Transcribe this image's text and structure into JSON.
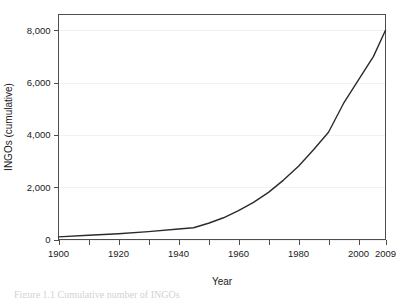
{
  "figure": {
    "caption": "Figure 1.1  Cumulative number of INGOs"
  },
  "chart_data": {
    "type": "line",
    "title": "",
    "xlabel": "Year",
    "ylabel": "INGOs (cumulative)",
    "xlim": [
      1900,
      2009
    ],
    "ylim": [
      0,
      8600
    ],
    "grid": true,
    "grid_axis": "y",
    "legend": false,
    "legend_position": "none",
    "line_color": "#2b2b2b",
    "x_ticks": [
      1900,
      1920,
      1940,
      1960,
      1980,
      2000,
      2009
    ],
    "x_tick_labels": [
      "1900",
      "1920",
      "1940",
      "1960",
      "1980",
      "2000",
      "2009"
    ],
    "x_minor_ticks": [
      1910,
      1930,
      1950,
      1970,
      1990
    ],
    "y_ticks": [
      0,
      2000,
      4000,
      6000,
      8000
    ],
    "y_tick_labels": [
      "0",
      "2,000",
      "4,000",
      "6,000",
      "8,000"
    ],
    "series": [
      {
        "name": "INGOs (cumulative)",
        "x": [
          1900,
          1910,
          1920,
          1930,
          1940,
          1945,
          1950,
          1955,
          1960,
          1965,
          1970,
          1975,
          1980,
          1985,
          1990,
          1995,
          2000,
          2005,
          2009
        ],
        "values": [
          100,
          160,
          220,
          300,
          400,
          450,
          620,
          830,
          1100,
          1420,
          1800,
          2270,
          2800,
          3430,
          4100,
          5200,
          6100,
          7000,
          8000
        ]
      }
    ]
  },
  "axis_titles": {
    "x": "Year",
    "y": "INGOs (cumulative)"
  }
}
